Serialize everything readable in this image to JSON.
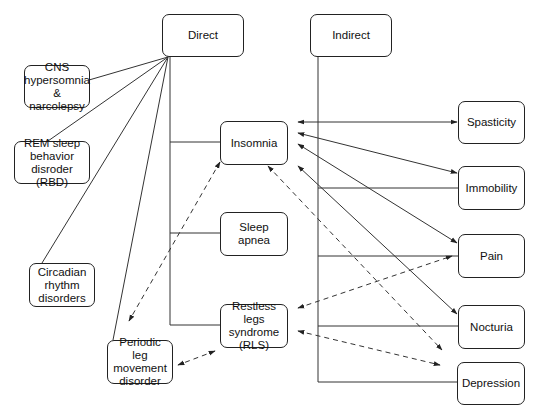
{
  "diagram": {
    "colors": {
      "line": "#333333",
      "box_border": "#222222",
      "background": "#ffffff",
      "text": "#111111"
    },
    "nodes": {
      "direct": {
        "label": "Direct"
      },
      "indirect": {
        "label": "Indirect"
      },
      "cns": {
        "label": "CNS\nhypersomnia\n& narcolepsy"
      },
      "rem": {
        "label": "REM sleep\nbehavior\ndisroder (RBD)"
      },
      "circadian": {
        "label": "Circadian\nrhythm\ndisorders"
      },
      "insomnia": {
        "label": "Insomnia"
      },
      "sleep_apnea": {
        "label": "Sleep apnea"
      },
      "rls": {
        "label": "Restless legs\nsyndrome\n(RLS)"
      },
      "plmd": {
        "label": "Periodic leg\nmovement\ndisorder"
      },
      "spasticity": {
        "label": "Spasticity"
      },
      "immobility": {
        "label": "Immobility"
      },
      "pain": {
        "label": "Pain"
      },
      "nocturia": {
        "label": "Nocturia"
      },
      "depression": {
        "label": "Depression"
      }
    },
    "edges": [
      {
        "from": "Direct",
        "to": "CNS hypersomnia & narcolepsy",
        "style": "solid"
      },
      {
        "from": "Direct",
        "to": "REM sleep behavior disroder (RBD)",
        "style": "solid"
      },
      {
        "from": "Direct",
        "to": "Circadian rhythm disorders",
        "style": "solid"
      },
      {
        "from": "Direct",
        "to": "Periodic leg movement disorder",
        "style": "solid"
      },
      {
        "from": "Direct",
        "to": "Insomnia",
        "style": "solid"
      },
      {
        "from": "Direct",
        "to": "Sleep apnea",
        "style": "solid"
      },
      {
        "from": "Direct",
        "to": "Restless legs syndrome (RLS)",
        "style": "solid"
      },
      {
        "from": "Indirect",
        "to": "Immobility",
        "style": "solid"
      },
      {
        "from": "Indirect",
        "to": "Pain",
        "style": "solid"
      },
      {
        "from": "Indirect",
        "to": "Nocturia",
        "style": "solid"
      },
      {
        "from": "Indirect",
        "to": "Depression",
        "style": "solid"
      },
      {
        "from": "Insomnia",
        "to": "Spasticity",
        "style": "solid",
        "arrows": "both"
      },
      {
        "from": "Insomnia",
        "to": "Immobility",
        "style": "solid",
        "arrows": "both"
      },
      {
        "from": "Insomnia",
        "to": "Pain",
        "style": "solid",
        "arrows": "both"
      },
      {
        "from": "Insomnia",
        "to": "Nocturia",
        "style": "solid",
        "arrows": "both"
      },
      {
        "from": "Insomnia",
        "to": "Periodic leg movement disorder",
        "style": "dashed",
        "arrows": "both"
      },
      {
        "from": "Insomnia",
        "to": "Depression",
        "style": "dashed",
        "arrows": "both"
      },
      {
        "from": "Restless legs syndrome (RLS)",
        "to": "Pain",
        "style": "dashed",
        "arrows": "both"
      },
      {
        "from": "Restless legs syndrome (RLS)",
        "to": "Depression",
        "style": "dashed",
        "arrows": "both"
      },
      {
        "from": "Restless legs syndrome (RLS)",
        "to": "Periodic leg movement disorder",
        "style": "dashed",
        "arrows": "both"
      }
    ]
  }
}
